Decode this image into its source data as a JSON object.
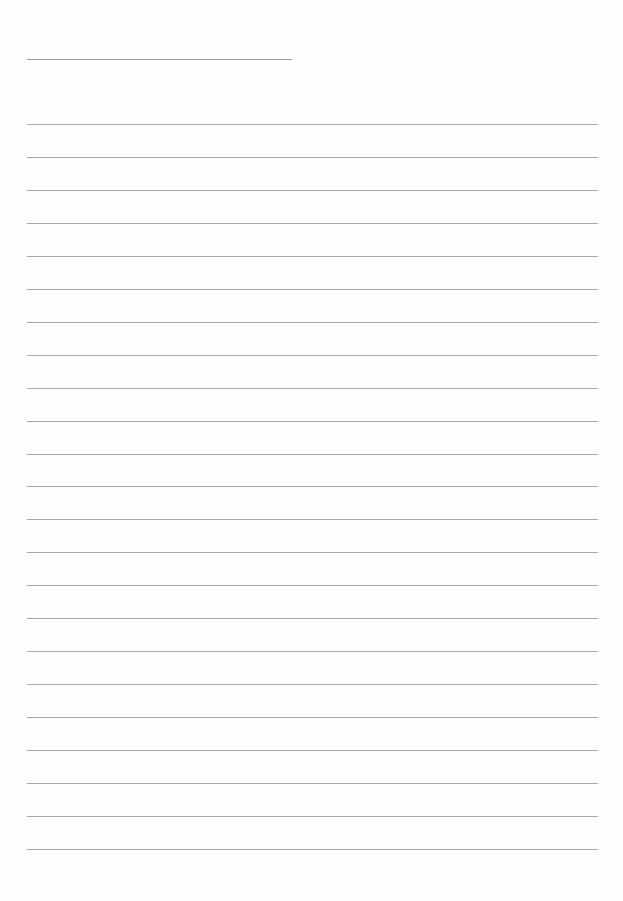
{
  "page": {
    "type": "lined-paper",
    "title_line": {
      "x": 27,
      "y": 59,
      "width": 265
    },
    "rules": {
      "count": 23,
      "start_y": 124,
      "spacing": 32.95,
      "x": 27,
      "width": 571,
      "color": "#a8a8a8"
    }
  }
}
